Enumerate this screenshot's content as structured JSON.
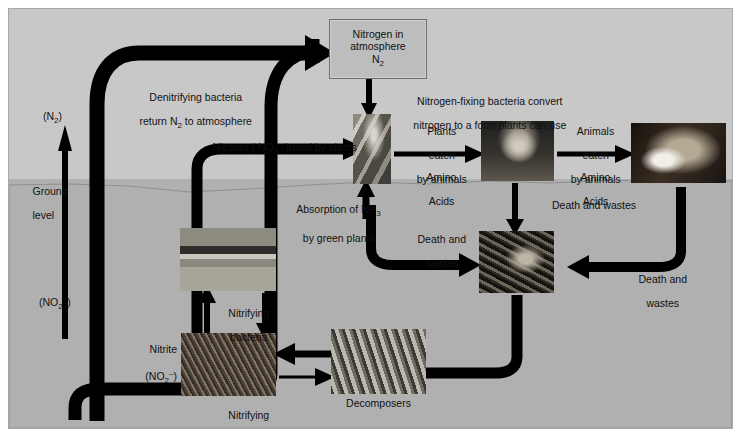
{
  "diagram": {
    "ground_label_line1": "Ground",
    "ground_label_line2": "level",
    "background_color": "#c8c8c8",
    "soil_color": "#b0b0b0",
    "ink_color": "#000000"
  },
  "atmosphere_box": {
    "line1": "Nitrogen in",
    "line2": "atmosphere",
    "line3": "N2",
    "fill": "#bdbdbd",
    "stroke": "#6e6e6e"
  },
  "labels": {
    "denitrifying_line1": "Denitrifying bacteria",
    "denitrifying_line2": "return N2 to atmosphere",
    "n2_gas": "(N2)",
    "no2_gas": "(NO2-)",
    "nitrates_used": "Nitrates ( NO3- )used by plants",
    "absorption_line1": "Absorption of NH3",
    "absorption_line2": "by green plants",
    "nitrogen_fixing_line1": "Nitrogen-fixing bacteria convert",
    "nitrogen_fixing_line2": "nitrogen to a form plants can use",
    "plants_eaten_line1": "Plants",
    "plants_eaten_line2": "eaten",
    "plants_eaten_line3": "by animals",
    "amino_acids_line1": "Amino",
    "amino_acids_line2": "Acids",
    "animals_eaten_line1": "Animals",
    "animals_eaten_line2": "eaten",
    "animals_eaten_line3": "by animals",
    "amino_acids2_line1": "Amino",
    "amino_acids2_line2": "Acids",
    "death_wastes_top": "Death and wastes",
    "death_wastes_left_line1": "Death and",
    "death_wastes_left_line2": "wastes",
    "death_wastes_right_line1": "Death and",
    "death_wastes_right_line2": "wastes",
    "nitrifying_mid_line1": "Nitrifying",
    "nitrifying_mid_line2": "bacteria",
    "nitrifying_bottom_line1": "Nitrifying",
    "nitrifying_bottom_line2": "bacteria",
    "nitrite_line1": "Nitrite",
    "nitrite_line2": "(NO2-)",
    "decomposers": "Decomposers"
  },
  "photos": {
    "roots": "plant-roots-nodules",
    "deer": "deer-herbivore",
    "fox": "fox-carnivore",
    "nitrate_soil": "nitrate-soil-micrograph",
    "nitrite_soil": "nitrite-bacteria-micrograph",
    "decomposers": "decomposer-bacteria-micrograph",
    "dead_animal": "dead-animal-remains"
  }
}
